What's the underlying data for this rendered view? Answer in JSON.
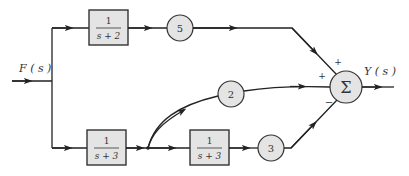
{
  "diagram": {
    "type": "block-diagram",
    "input_label": "F ( s )",
    "output_label": "Y ( s )",
    "blocks": [
      {
        "id": "G1",
        "numerator": "1",
        "denominator": "s + 2"
      },
      {
        "id": "G2",
        "numerator": "1",
        "denominator": "s + 3"
      },
      {
        "id": "G3",
        "numerator": "1",
        "denominator": "s + 3"
      }
    ],
    "gains": [
      {
        "id": "K5",
        "value": "5"
      },
      {
        "id": "K2",
        "value": "2"
      },
      {
        "id": "K3",
        "value": "3"
      }
    ],
    "summer": {
      "symbol": "Σ",
      "signs": {
        "top": "+",
        "left": "+",
        "bottom": "−"
      }
    },
    "connections": [
      "F(s) → 1/(s+2) → 5 → Σ (+)",
      "F(s) → 1/(s+3) → 2 → Σ (+)",
      "F(s) → 1/(s+3) → 1/(s+3) → 3 → Σ (−)",
      "Σ → Y(s)"
    ]
  }
}
